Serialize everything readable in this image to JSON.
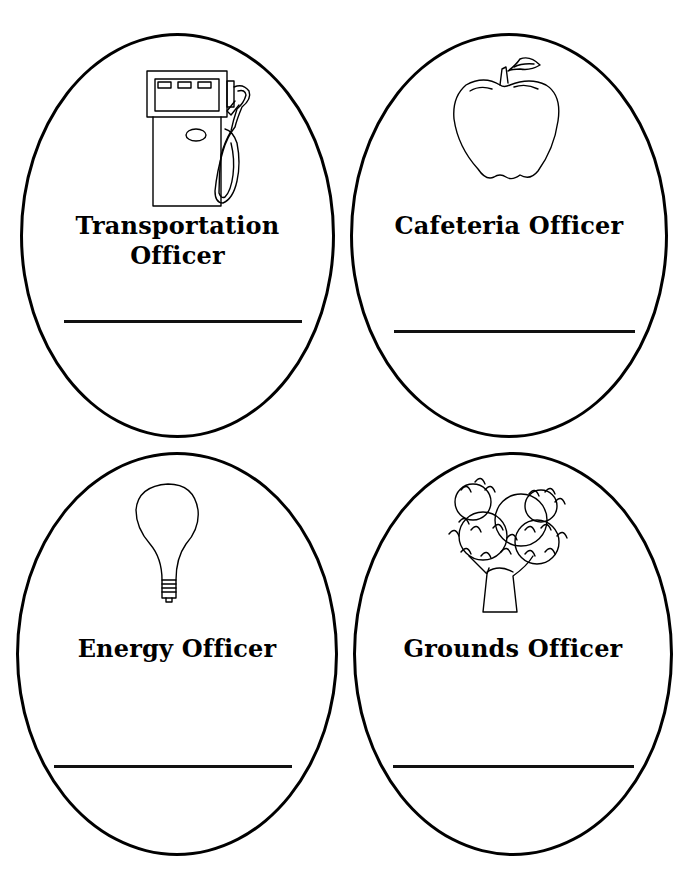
{
  "page": {
    "background_color": "#ffffff",
    "ink_color": "#000000"
  },
  "badges": [
    {
      "id": "transportation",
      "title_line1": "Transportation",
      "title_line2": "Officer",
      "icon": "gas-pump-icon",
      "name_line": ""
    },
    {
      "id": "cafeteria",
      "title_line1": "Cafeteria Officer",
      "title_line2": "",
      "icon": "apple-icon",
      "name_line": ""
    },
    {
      "id": "energy",
      "title_line1": "Energy Officer",
      "title_line2": "",
      "icon": "light-bulb-icon",
      "name_line": ""
    },
    {
      "id": "grounds",
      "title_line1": "Grounds Officer",
      "title_line2": "",
      "icon": "tree-icon",
      "name_line": ""
    }
  ]
}
